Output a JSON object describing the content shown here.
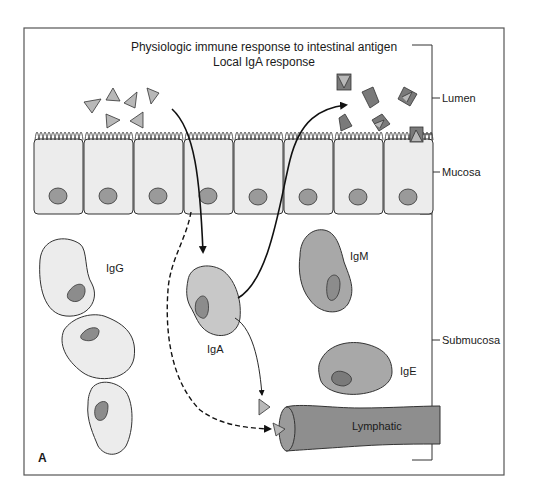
{
  "figure": {
    "title_line1": "Physiologic immune response to intestinal antigen",
    "title_line2": "Local IgA response",
    "panel_label": "A"
  },
  "layers": {
    "lumen": "Lumen",
    "mucosa": "Mucosa",
    "submucosa": "Submucosa"
  },
  "cells": {
    "igg": "IgG",
    "iga": "IgA",
    "igm": "IgM",
    "ige": "IgE"
  },
  "vessel": {
    "lymphatic": "Lymphatic"
  },
  "colors": {
    "frame": "#555555",
    "cell_light": "#ececec",
    "cell_mid": "#c8c8c8",
    "cell_dark": "#a8a8a8",
    "nucleus": "#8c8c8c",
    "antigen_light": "#b8b8b8",
    "antigen_dark": "#7a7a7a",
    "lymphatic": "#8e8e8e"
  }
}
